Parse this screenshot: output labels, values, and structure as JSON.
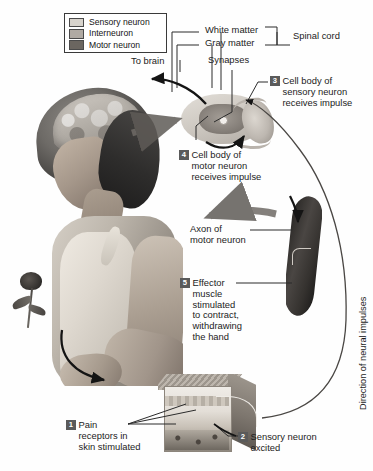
{
  "diagram": {
    "legend": {
      "name": "neuron-type-legend",
      "items": [
        {
          "label": "Sensory neuron",
          "color": "#d8d4cd"
        },
        {
          "label": "Interneuron",
          "color": "#b0aaa3"
        },
        {
          "label": "Motor neuron",
          "color": "#6b6660"
        }
      ]
    },
    "labels": {
      "to_brain": "To brain",
      "white_matter": "White matter",
      "gray_matter": "Gray matter",
      "spinal_cord": "Spinal cord",
      "synapses": "Synapses",
      "axon_of_motor_neuron_line1": "Axon of",
      "axon_of_motor_neuron_line2": "motor neuron",
      "direction_of_neural_impulses": "Direction of neural impulses"
    },
    "steps": [
      {
        "number": "1",
        "name": "step-1-pain-receptors",
        "lines": [
          "Pain",
          "receptors in",
          "skin stimulated"
        ]
      },
      {
        "number": "2",
        "name": "step-2-sensory-neuron-excited",
        "lines": [
          "Sensory neuron",
          "excited"
        ]
      },
      {
        "number": "3",
        "name": "step-3-sensory-cell-body",
        "lines": [
          "Cell body of",
          "sensory neuron",
          "receives impulse"
        ]
      },
      {
        "number": "4",
        "name": "step-4-motor-cell-body",
        "lines": [
          "Cell body of",
          "motor neuron",
          "receives impulse"
        ]
      },
      {
        "number": "5",
        "name": "step-5-effector-muscle",
        "lines": [
          "Effector",
          "muscle",
          "stimulated",
          "to contract,",
          "withdrawing",
          "the hand"
        ]
      }
    ],
    "figures": {
      "woman": "woman-with-exposed-brain-photo",
      "rose": "rose-flower",
      "spinal_cord": "spinal-cord-cross-section",
      "muscle": "effector-muscle",
      "skin": "skin-block-cross-section"
    },
    "colors": {
      "text": "#1c1c1c",
      "badge_bg": "#5a5a5a",
      "badge_text": "#ffffff",
      "leader_line": "#2b2b2b",
      "background": "#ffffff"
    }
  }
}
